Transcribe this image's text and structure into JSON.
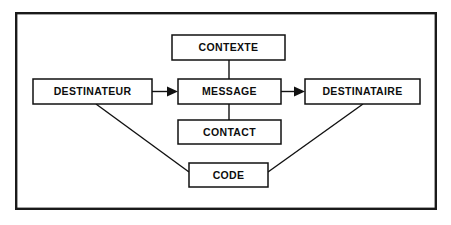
{
  "figure": {
    "language": "fr",
    "background_color": "#ffffff",
    "frame_color": "#1a1a1a",
    "box_fill": "#ffffff",
    "box_stroke": "#111111",
    "text_color": "#0d0d0d"
  },
  "frame": {
    "x": 15,
    "y": 12,
    "width": 422,
    "height": 198
  },
  "nodes": [
    {
      "id": "contexte",
      "label": "CONTEXTE",
      "x": 172,
      "y": 35,
      "width": 113,
      "height": 25,
      "cx": 228.5,
      "cy": 47.5
    },
    {
      "id": "destinateur",
      "label": "DESTINATEUR",
      "x": 33,
      "y": 79,
      "width": 119,
      "height": 25,
      "cx": 92.5,
      "cy": 91.5
    },
    {
      "id": "message",
      "label": "MESSAGE",
      "x": 178,
      "y": 79,
      "width": 103,
      "height": 25,
      "cx": 229.5,
      "cy": 91.5
    },
    {
      "id": "destinataire",
      "label": "DESTINATAIRE",
      "x": 305,
      "y": 79,
      "width": 115,
      "height": 25,
      "cx": 362.5,
      "cy": 91.5
    },
    {
      "id": "contact",
      "label": "CONTACT",
      "x": 178,
      "y": 120,
      "width": 103,
      "height": 24,
      "cx": 229.5,
      "cy": 132
    },
    {
      "id": "code",
      "label": "CODE",
      "x": 189,
      "y": 163,
      "width": 79,
      "height": 24,
      "cx": 228.5,
      "cy": 175
    }
  ],
  "connectors": [
    {
      "id": "contexte-to-message",
      "from": "contexte",
      "to": "message",
      "kind": "line",
      "x1": 229,
      "y1": 60,
      "x2": 229,
      "y2": 79
    },
    {
      "id": "destinateur-to-message",
      "from": "destinateur",
      "to": "message",
      "kind": "arrow",
      "x1": 152,
      "y1": 91.5,
      "x2": 178,
      "y2": 91.5
    },
    {
      "id": "message-to-destinataire",
      "from": "message",
      "to": "destinataire",
      "kind": "arrow",
      "x1": 281,
      "y1": 91.5,
      "x2": 305,
      "y2": 91.5
    },
    {
      "id": "message-to-contact",
      "from": "message",
      "to": "contact",
      "kind": "line",
      "x1": 229,
      "y1": 104,
      "x2": 229,
      "y2": 120
    },
    {
      "id": "destinateur-to-code",
      "from": "destinateur",
      "to": "code",
      "kind": "line",
      "x1": 96,
      "y1": 104,
      "x2": 189,
      "y2": 172
    },
    {
      "id": "code-to-destinataire",
      "from": "code",
      "to": "destinataire",
      "kind": "line",
      "x1": 268,
      "y1": 172,
      "x2": 363,
      "y2": 104
    }
  ]
}
